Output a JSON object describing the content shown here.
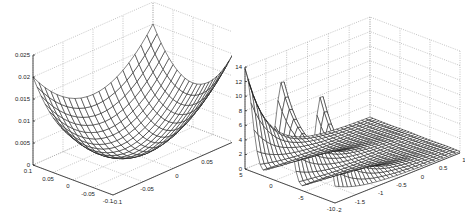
{
  "chart_data": [
    {
      "type": "surface",
      "title": "",
      "xlabel": "",
      "ylabel": "",
      "zlabel": "",
      "function": "paraboloid bowl z = (x^2 + y^2)",
      "x_ticks": [
        "-0.1",
        "-0.05",
        "0",
        "0.05",
        "0.1"
      ],
      "y_ticks": [
        "-0.1",
        "-0.05",
        "0",
        "0.05",
        "0.1"
      ],
      "z_ticks": [
        "0",
        "0.005",
        "0.01",
        "0.015",
        "0.02",
        "0.025"
      ],
      "xlim": [
        -0.1,
        0.1
      ],
      "ylim": [
        -0.1,
        0.1
      ],
      "zlim": [
        0,
        0.025
      ],
      "grid": true,
      "mesh_resolution": 21,
      "z_corner_max": 0.02,
      "legend": null
    },
    {
      "type": "surface",
      "title": "",
      "xlabel": "",
      "ylabel": "",
      "zlabel": "",
      "function": "three peaks along y at x=-2, decaying in x",
      "x_ticks": [
        "-2",
        "-1.5",
        "-1",
        "-0.5",
        "0",
        "0.5",
        "1"
      ],
      "y_ticks": [
        "-10",
        "-5",
        "0",
        "5"
      ],
      "z_ticks": [
        "0",
        "2",
        "4",
        "6",
        "8",
        "10",
        "12",
        "14"
      ],
      "xlim": [
        -2,
        1
      ],
      "ylim": [
        -10,
        5
      ],
      "zlim": [
        0,
        14
      ],
      "grid": true,
      "peaks": [
        {
          "y": 5,
          "z": 13.6
        },
        {
          "y": -1.3,
          "z": 14
        },
        {
          "y": -7.8,
          "z": 14
        }
      ],
      "mesh_resolution": 31,
      "legend": null
    }
  ],
  "ui": {
    "left_panel_name": "left-surface-plot",
    "right_panel_name": "right-surface-plot"
  }
}
